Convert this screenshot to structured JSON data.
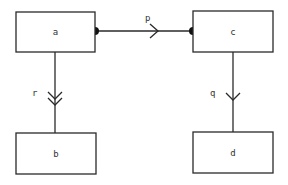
{
  "diagram": {
    "nodes": [
      {
        "id": "a",
        "label": "a"
      },
      {
        "id": "b",
        "label": "b"
      },
      {
        "id": "c",
        "label": "c"
      },
      {
        "id": "d",
        "label": "d"
      }
    ],
    "edges": [
      {
        "id": "p",
        "label": "p",
        "from": "a",
        "to": "c",
        "tail": "dot",
        "head": "dot",
        "arrow": "single-open-chevron"
      },
      {
        "id": "r",
        "label": "r",
        "from": "a",
        "to": "b",
        "arrow": "double-open-chevron"
      },
      {
        "id": "q",
        "label": "q",
        "from": "c",
        "to": "d",
        "arrow": "single-open-chevron"
      }
    ]
  }
}
